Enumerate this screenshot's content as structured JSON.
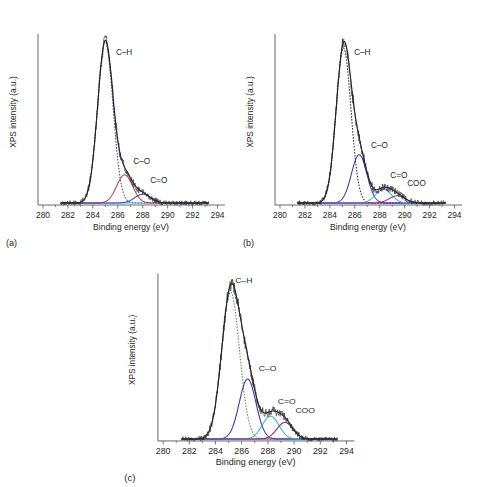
{
  "figure": {
    "panels": [
      {
        "tag": "(a)",
        "xlabel": "Binding energy (eV)",
        "ylabel": "XPS intensity (a.u.)",
        "peak_labels": [
          "C–H",
          "C–O",
          "C=O"
        ]
      },
      {
        "tag": "(b)",
        "xlabel": "Binding energy (eV)",
        "ylabel": "XPS intensity (a.u.)",
        "peak_labels": [
          "C–H",
          "C–O",
          "C=O",
          "COO"
        ]
      },
      {
        "tag": "(c)",
        "xlabel": "Binding energy (eV)",
        "ylabel": "XPS intensity (a.u.)",
        "peak_labels": [
          "C–H",
          "C–O",
          "C=O",
          "COO"
        ]
      }
    ]
  },
  "chart_data": [
    {
      "id": "panel-a",
      "type": "line",
      "title": "",
      "panel_tag": "(a)",
      "xlabel": "Binding energy (eV)",
      "ylabel": "XPS intensity (a.u.)",
      "xlim": [
        279.6,
        294.6
      ],
      "ylim": [
        0,
        1.06
      ],
      "xticks": [
        280,
        282,
        284,
        286,
        288,
        290,
        292,
        294
      ],
      "xtick_labels": [
        "280",
        "282",
        "284",
        "286",
        "288",
        "290",
        "292",
        "294"
      ],
      "yticks": [],
      "grid": false,
      "legend": "none (inline peak annotations)",
      "data_range_x": [
        281.4,
        293.3
      ],
      "series": [
        {
          "name": "C–H",
          "label": "C–H",
          "type": "fitted component",
          "color": "#3b4a9c",
          "style": "dotted",
          "center": 285.0,
          "fwhm": 1.45,
          "amplitude": 1.0,
          "label_x": 285.85,
          "label_y": 0.93
        },
        {
          "name": "C–O",
          "label": "C–O",
          "type": "fitted component",
          "color": "#b4493c",
          "style": "solid",
          "center": 286.55,
          "fwhm": 1.5,
          "amplitude": 0.175,
          "label_x": 287.25,
          "label_y": 0.255
        },
        {
          "name": "C=O",
          "label": "C=O",
          "type": "fitted component",
          "color": "#3b3fa0",
          "style": "solid",
          "center": 288.0,
          "fwhm": 1.5,
          "amplitude": 0.055,
          "label_x": 288.6,
          "label_y": 0.135
        },
        {
          "name": "background",
          "label": "",
          "type": "baseline",
          "color": "#55c8e8",
          "style": "solid",
          "amplitude": 0.012
        },
        {
          "name": "envelope",
          "label": "",
          "type": "fit envelope",
          "color": "#1a1a1a",
          "style": "solid"
        },
        {
          "name": "measured data",
          "label": "",
          "type": "scatter/noise trace",
          "color": "#2b2b2b",
          "style": "points"
        }
      ]
    },
    {
      "id": "panel-b",
      "type": "line",
      "title": "",
      "panel_tag": "(b)",
      "xlabel": "Binding energy (eV)",
      "ylabel": "XPS intensity (a.u.)",
      "xlim": [
        279.6,
        294.6
      ],
      "ylim": [
        0,
        1.06
      ],
      "xticks": [
        280,
        282,
        284,
        286,
        288,
        290,
        292,
        294
      ],
      "xtick_labels": [
        "280",
        "282",
        "284",
        "286",
        "288",
        "290",
        "292",
        "294"
      ],
      "yticks": [],
      "grid": false,
      "legend": "none (inline peak annotations)",
      "data_range_x": [
        281.4,
        293.3
      ],
      "series": [
        {
          "name": "C–H",
          "label": "C–H",
          "type": "fitted component",
          "color": "#2f2f33",
          "style": "dotted",
          "center": 285.1,
          "fwhm": 1.4,
          "amplitude": 0.96,
          "label_x": 285.95,
          "label_y": 0.93
        },
        {
          "name": "C–O",
          "label": "C–O",
          "type": "fitted component",
          "color": "#4036b5",
          "style": "solid",
          "center": 286.35,
          "fwhm": 1.45,
          "amplitude": 0.3,
          "label_x": 287.3,
          "label_y": 0.355
        },
        {
          "name": "C=O",
          "label": "C=O",
          "type": "fitted component",
          "color": "#39b6d8",
          "style": "solid",
          "center": 288.3,
          "fwhm": 1.5,
          "amplitude": 0.085,
          "label_x": 288.85,
          "label_y": 0.165
        },
        {
          "name": "COO",
          "label": "COO",
          "type": "fitted component",
          "color": "#8b2f8b",
          "style": "solid",
          "center": 289.4,
          "fwhm": 1.5,
          "amplitude": 0.045,
          "label_x": 290.2,
          "label_y": 0.115
        },
        {
          "name": "background",
          "label": "",
          "type": "baseline",
          "color": "#8b2f8b",
          "style": "solid",
          "amplitude": 0.012
        },
        {
          "name": "envelope",
          "label": "",
          "type": "fit envelope",
          "color": "#1a1a1a",
          "style": "solid"
        },
        {
          "name": "measured data",
          "label": "",
          "type": "scatter/noise trace",
          "color": "#2b2b2b",
          "style": "points"
        }
      ]
    },
    {
      "id": "panel-c",
      "type": "line",
      "title": "",
      "panel_tag": "(c)",
      "xlabel": "Binding energy (eV)",
      "ylabel": "XPS intensity (a.u.)",
      "xlim": [
        279.6,
        294.6
      ],
      "ylim": [
        0,
        1.06
      ],
      "xticks": [
        280,
        282,
        284,
        286,
        288,
        290,
        292,
        294
      ],
      "xtick_labels": [
        "280",
        "282",
        "284",
        "286",
        "288",
        "290",
        "292",
        "294"
      ],
      "yticks": [],
      "grid": false,
      "legend": "none (inline peak annotations)",
      "data_range_x": [
        281.4,
        293.3
      ],
      "series": [
        {
          "name": "C–H",
          "label": "C–H",
          "type": "fitted component",
          "color": "#4aa84a",
          "style": "dotted",
          "center": 285.15,
          "fwhm": 1.6,
          "amplitude": 0.93,
          "label_x": 285.5,
          "label_y": 1.0
        },
        {
          "name": "C–O",
          "label": "C–O",
          "type": "fitted component",
          "color": "#4036b5",
          "style": "solid",
          "center": 286.45,
          "fwhm": 1.5,
          "amplitude": 0.38,
          "label_x": 287.3,
          "label_y": 0.44
        },
        {
          "name": "C=O",
          "label": "C=O",
          "type": "fitted component",
          "color": "#39b6d8",
          "style": "solid",
          "center": 288.2,
          "fwhm": 1.5,
          "amplitude": 0.145,
          "label_x": 288.75,
          "label_y": 0.235
        },
        {
          "name": "COO",
          "label": "COO",
          "type": "fitted component",
          "color": "#7a2a7a",
          "style": "solid",
          "center": 289.3,
          "fwhm": 1.45,
          "amplitude": 0.105,
          "label_x": 290.1,
          "label_y": 0.175
        },
        {
          "name": "background",
          "label": "",
          "type": "baseline",
          "color": "#7a2a7a",
          "style": "solid",
          "amplitude": 0.012
        },
        {
          "name": "envelope",
          "label": "",
          "type": "fit envelope",
          "color": "#1a1a1a",
          "style": "solid"
        },
        {
          "name": "measured data",
          "label": "",
          "type": "scatter/noise trace",
          "color": "#2b2b2b",
          "style": "points"
        }
      ]
    }
  ]
}
